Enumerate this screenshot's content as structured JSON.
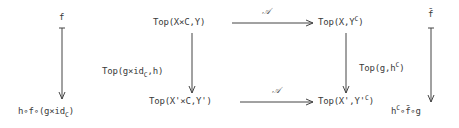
{
  "diagram": {
    "type": "commutative-diagram",
    "nodes": {
      "f_top": "f",
      "f_bottom_parts": [
        "h",
        "∘",
        "f",
        "∘",
        "(g×id",
        "C",
        ")"
      ],
      "top_left": {
        "text": "Top(X×C,Y)"
      },
      "top_right": {
        "pre": "Top(X,Y",
        "sup": "C",
        "post": ")"
      },
      "bottom_left": {
        "text": "Top(X'×C,Y')"
      },
      "bottom_right": {
        "pre": "Top(X',Y'",
        "sup": "C",
        "post": ")"
      },
      "fbar_top": "f̄",
      "fbar_bottom": {
        "h": "h",
        "sup": "C",
        "rest": "∘f̄∘g"
      }
    },
    "arrows": {
      "top_horizontal_label": "𝒜",
      "bottom_horizontal_label": "𝒜",
      "left_vertical_label": {
        "pre": "Top(g×id",
        "sub": "C",
        "post": ",h)"
      },
      "right_vertical_label": {
        "pre": "Top(g,h",
        "sup": "C",
        "post": ")"
      }
    },
    "colors": {
      "ink": "#3a3a3a",
      "background": "#ffffff"
    }
  }
}
